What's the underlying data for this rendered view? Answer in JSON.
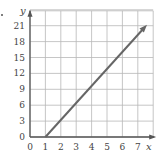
{
  "chart_data": {
    "type": "line",
    "title": "",
    "xlabel": "x",
    "ylabel": "y",
    "xlim": [
      0,
      8
    ],
    "ylim": [
      0,
      24
    ],
    "grid": true,
    "x_ticks": [
      "0",
      "1",
      "2",
      "3",
      "4",
      "5",
      "6",
      "7"
    ],
    "y_ticks": [
      "0",
      "3",
      "6",
      "9",
      "12",
      "15",
      "18",
      "21"
    ],
    "series": [
      {
        "name": "line",
        "x": [
          1,
          7.6
        ],
        "y": [
          0,
          21.2
        ],
        "arrow_end": true,
        "color": "#666666"
      }
    ]
  },
  "labels": {
    "x_axis": "x",
    "y_axis": "y",
    "bullet": "•"
  }
}
